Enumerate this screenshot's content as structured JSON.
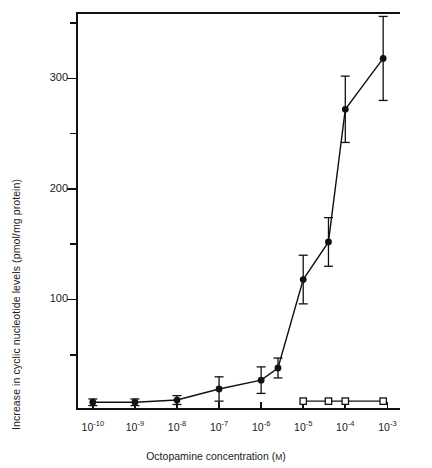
{
  "chart_data": {
    "type": "line",
    "title": "",
    "xlabel": "Octopamine concentration (M)",
    "ylabel": "Increase in cyclic nucleotide levels (pmol/mg protein)",
    "xlabel_unit": "M",
    "xlabel_main": "Octopamine concentration (",
    "xlabel_close": ")",
    "x_tick_labels": [
      "10-10",
      "10-9",
      "10-8",
      "10-7",
      "10-6",
      "10-5",
      "10-4",
      "10-3"
    ],
    "x_tick_bases": [
      "10",
      "10",
      "10",
      "10",
      "10",
      "10",
      "10",
      "10"
    ],
    "x_tick_exponents": [
      "-10",
      "-9",
      "-8",
      "-7",
      "-6",
      "-5",
      "-4",
      "-3"
    ],
    "x_log_values": [
      -10,
      -9,
      -8,
      -7,
      -6,
      -5,
      -4,
      -3
    ],
    "y_tick_labels": [
      "100",
      "200",
      "300"
    ],
    "y_tick_values": [
      100,
      200,
      300
    ],
    "ylim": [
      0,
      360
    ],
    "xlim": [
      -10.4,
      -2.7
    ],
    "grid": false,
    "legend": "none",
    "series": [
      {
        "name": "octopamine-stimulated",
        "marker": "filled-circle",
        "points": [
          {
            "x": -10.0,
            "y": 7,
            "err": 3
          },
          {
            "x": -9.0,
            "y": 7,
            "err": 3
          },
          {
            "x": -8.0,
            "y": 9,
            "err": 4
          },
          {
            "x": -7.0,
            "y": 19,
            "err": 11
          },
          {
            "x": -6.0,
            "y": 27,
            "err": 12
          },
          {
            "x": -5.6,
            "y": 38,
            "err": 9
          },
          {
            "x": -5.0,
            "y": 118,
            "err": 22
          },
          {
            "x": -4.4,
            "y": 152,
            "err": 22
          },
          {
            "x": -4.0,
            "y": 272,
            "err": 30
          },
          {
            "x": -3.1,
            "y": 318,
            "err": 38
          }
        ]
      },
      {
        "name": "control",
        "marker": "open-square",
        "points": [
          {
            "x": -5.0,
            "y": 8,
            "err": 0
          },
          {
            "x": -4.4,
            "y": 8,
            "err": 0
          },
          {
            "x": -4.0,
            "y": 8,
            "err": 0
          },
          {
            "x": -3.1,
            "y": 8,
            "err": 0
          }
        ]
      }
    ],
    "colors": {
      "line": "#111111",
      "marker": "#111111",
      "axis": "#111111"
    }
  }
}
